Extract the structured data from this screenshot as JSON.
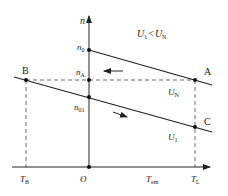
{
  "diagram": {
    "type": "motor-speed-torque-characteristic",
    "condition_label": {
      "u": "U",
      "sub1": "1",
      "op": "<",
      "u2": "U",
      "sub2": "N"
    },
    "axes": {
      "y_label": "n",
      "x_label": {
        "main": "T",
        "sub": "em"
      },
      "origin": "O"
    },
    "y_ticks": [
      {
        "main": "n",
        "sub": "0"
      },
      {
        "main": "n",
        "sub": "A"
      },
      {
        "main": "n",
        "sub": "01"
      }
    ],
    "x_ticks": [
      {
        "main": "T",
        "sub": "B"
      },
      {
        "main": "T",
        "sub": "L"
      }
    ],
    "points": {
      "A": "A",
      "B": "B",
      "C": "C"
    },
    "curves": [
      {
        "name": "U_N characteristic",
        "label": {
          "main": "U",
          "sub": "N"
        }
      },
      {
        "name": "U_1 characteristic",
        "label": {
          "main": "U",
          "sub": "1"
        }
      }
    ],
    "colors": {
      "line": "#222222",
      "dashed": "#444444",
      "background": "#ffffff"
    }
  }
}
